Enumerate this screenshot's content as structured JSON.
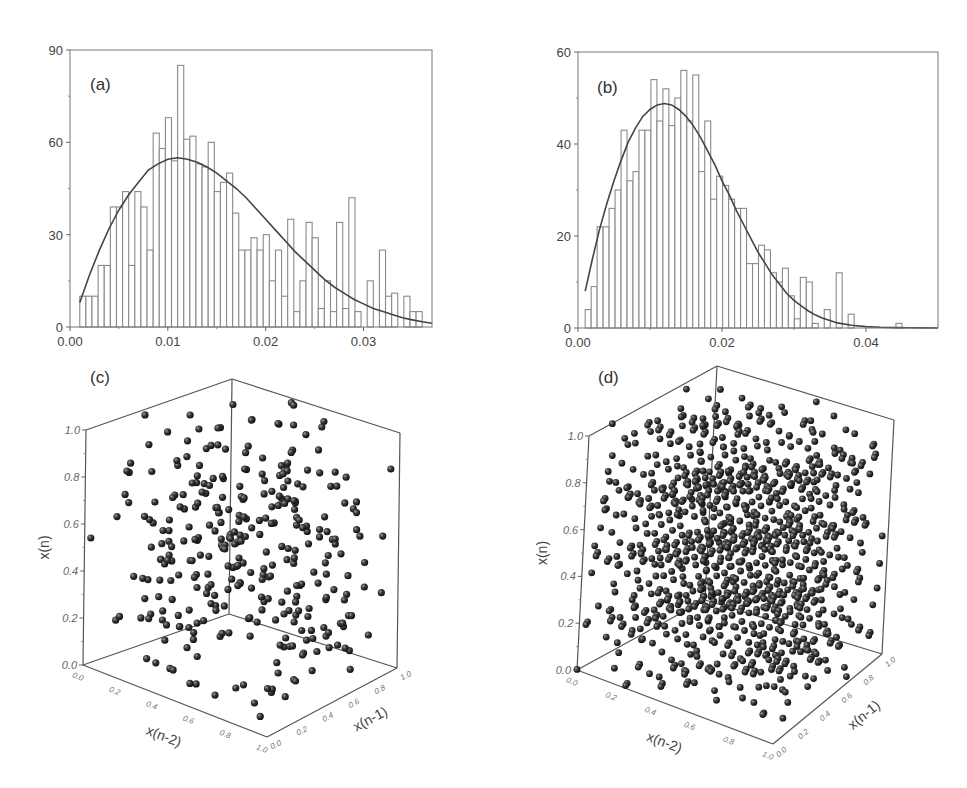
{
  "chart_data": [
    {
      "id": "a",
      "type": "bar",
      "panel_label": "(a)",
      "title": "",
      "xlabel": "",
      "ylabel": "",
      "xlim": [
        0.0,
        0.037
      ],
      "ylim": [
        0,
        90
      ],
      "xticks": [
        "0.00",
        "0.01",
        "0.02",
        "0.03"
      ],
      "xtick_values": [
        0.0,
        0.01,
        0.02,
        0.03
      ],
      "yticks": [
        "0",
        "30",
        "60",
        "90"
      ],
      "ytick_values": [
        0,
        30,
        60,
        90
      ],
      "grid": false,
      "bin_start": 0.001,
      "bin_width": 0.000625,
      "values": [
        10,
        10,
        10,
        20,
        20,
        39,
        39,
        44,
        20,
        44,
        39,
        25,
        63,
        58,
        68,
        54,
        85,
        61,
        62,
        53,
        52,
        60,
        44,
        47,
        50,
        37,
        25,
        25,
        29,
        25,
        30,
        15,
        25,
        10,
        35,
        5,
        15,
        34,
        29,
        6,
        15,
        5,
        34,
        6,
        42,
        5,
        0,
        15,
        0,
        25,
        10,
        11,
        0,
        10,
        5,
        5
      ],
      "fit_curve": {
        "type": "line",
        "description": "fitted distribution curve",
        "x": [
          0.001,
          0.002,
          0.003,
          0.004,
          0.005,
          0.006,
          0.007,
          0.008,
          0.009,
          0.01,
          0.011,
          0.012,
          0.013,
          0.014,
          0.015,
          0.016,
          0.017,
          0.018,
          0.019,
          0.02,
          0.021,
          0.022,
          0.023,
          0.024,
          0.025,
          0.026,
          0.027,
          0.028,
          0.029,
          0.03,
          0.031,
          0.032,
          0.033,
          0.034,
          0.035,
          0.036,
          0.037
        ],
        "y": [
          8,
          17,
          25,
          32,
          38,
          43,
          47,
          51,
          53,
          54.5,
          55,
          54.5,
          53.5,
          52,
          50,
          47.5,
          45,
          42,
          38.5,
          35,
          31.5,
          28,
          24.5,
          21.5,
          18.5,
          15.5,
          13,
          11,
          9,
          7.5,
          6,
          5,
          4,
          3,
          2.3,
          1.7,
          1.2
        ]
      }
    },
    {
      "id": "b",
      "type": "bar",
      "panel_label": "(b)",
      "title": "",
      "xlabel": "",
      "ylabel": "",
      "xlim": [
        0.0,
        0.05
      ],
      "ylim": [
        0,
        60
      ],
      "xticks": [
        "0.00",
        "0.02",
        "0.04"
      ],
      "xtick_values": [
        0.0,
        0.02,
        0.04
      ],
      "yticks": [
        "0",
        "20",
        "40",
        "60"
      ],
      "ytick_values": [
        0,
        20,
        40,
        60
      ],
      "grid": false,
      "bin_start": 0.001,
      "bin_width": 0.00083,
      "values": [
        4,
        9,
        22,
        22,
        26,
        30,
        43,
        32,
        34,
        43,
        43,
        54,
        45,
        52,
        44,
        50,
        56,
        45,
        55,
        34,
        45,
        28,
        33,
        31,
        28,
        26,
        26,
        14,
        14,
        18,
        17,
        12,
        10,
        13,
        7,
        2,
        11,
        10,
        1,
        0,
        4,
        0,
        12,
        0,
        3,
        0,
        0,
        0,
        0,
        0,
        0,
        0,
        1
      ],
      "fit_curve": {
        "type": "line",
        "description": "fitted distribution curve",
        "x": [
          0.001,
          0.002,
          0.003,
          0.004,
          0.005,
          0.006,
          0.007,
          0.008,
          0.009,
          0.01,
          0.011,
          0.012,
          0.013,
          0.014,
          0.015,
          0.016,
          0.017,
          0.018,
          0.019,
          0.02,
          0.021,
          0.022,
          0.023,
          0.024,
          0.025,
          0.026,
          0.027,
          0.028,
          0.029,
          0.03,
          0.031,
          0.032,
          0.033,
          0.034,
          0.035,
          0.036,
          0.038,
          0.04,
          0.042,
          0.044,
          0.046,
          0.048,
          0.05
        ],
        "y": [
          8,
          15,
          21.5,
          27,
          32,
          36.5,
          40.5,
          43.5,
          46,
          47.5,
          48.5,
          48.8,
          48.5,
          47.5,
          46,
          44,
          41.5,
          38.5,
          35.5,
          32,
          29,
          25.5,
          22.5,
          19.5,
          16.5,
          14,
          11.5,
          9.5,
          7.5,
          6,
          4.8,
          3.7,
          2.8,
          2.1,
          1.6,
          1.1,
          0.6,
          0.3,
          0.15,
          0.08,
          0.04,
          0.02,
          0.01
        ]
      }
    },
    {
      "id": "c",
      "type": "scatter",
      "panel_label": "(c)",
      "dimensions": 3,
      "xlabel": "x(n-2)",
      "ylabel": "x(n-1)",
      "zlabel": "x(n)",
      "xlim": [
        0,
        1
      ],
      "ylim": [
        0,
        1
      ],
      "zlim": [
        0,
        1
      ],
      "ticks": [
        "0.0",
        "0.2",
        "0.4",
        "0.6",
        "0.8",
        "1.0"
      ],
      "description": "3D return map of uniformly scattered points (no visible structure)",
      "point_count_approx": 330
    },
    {
      "id": "d",
      "type": "scatter",
      "panel_label": "(d)",
      "dimensions": 3,
      "xlabel": "x(n-2)",
      "ylabel": "x(n-1)",
      "zlabel": "x(n)",
      "xlim": [
        0,
        1
      ],
      "ylim": [
        0,
        1
      ],
      "zlim": [
        0,
        1
      ],
      "ticks": [
        "0.0",
        "0.2",
        "0.4",
        "0.6",
        "0.8",
        "1.0"
      ],
      "description": "3D return map showing points arranged on a regular lattice of parallel planes",
      "point_count_approx": 1000
    }
  ],
  "colors": {
    "bar_stroke": "#8a8a8a",
    "curve": "#444444",
    "axis": "#666666",
    "sphere": "#2a2a2a"
  }
}
